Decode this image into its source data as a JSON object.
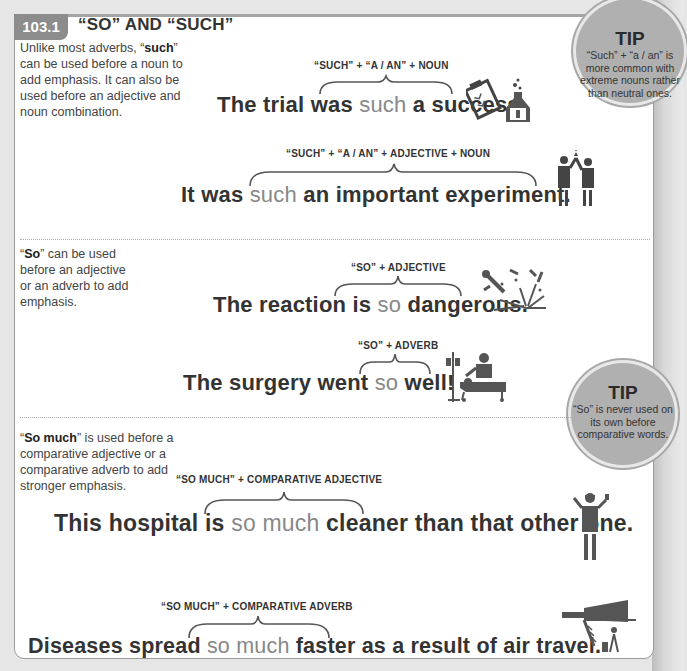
{
  "header": {
    "section_number": "103.1",
    "title": "“SO” AND “SUCH”"
  },
  "sections": [
    {
      "description": {
        "pre": "Unlike most adverbs, “",
        "bold": "such",
        "post": "” can be used before a noun to add emphasis. It can also be used before an adjective and noun combination."
      },
      "examples": [
        {
          "formula": "“SUCH” + “A / AN” + NOUN",
          "sentence": {
            "pre": "The trial was ",
            "highlight": "such",
            "post": " a success."
          },
          "icon": "clipboard-and-flask-icon"
        },
        {
          "formula": "“SUCH” + “A / AN” + ADJECTIVE + NOUN",
          "sentence": {
            "pre": "It was ",
            "highlight": "such",
            "post": " an important experiment."
          },
          "icon": "scientists-celebrating-icon"
        }
      ]
    },
    {
      "description": {
        "pre": "“",
        "bold": "So",
        "post": "” can be used before an adjective or an adverb to add emphasis."
      },
      "examples": [
        {
          "formula": "“SO” + ADJECTIVE",
          "sentence": {
            "pre": "The reaction is ",
            "highlight": "so",
            "post": " dangerous."
          },
          "icon": "explosion-icon"
        },
        {
          "formula": "“SO” + ADVERB",
          "sentence": {
            "pre": "The surgery went ",
            "highlight": "so",
            "post": " well!"
          },
          "icon": "surgery-patient-icon"
        }
      ]
    },
    {
      "description": {
        "pre": "“",
        "bold": "So much",
        "post": "” is used before a comparative adjective or a comparative adverb to add stronger emphasis."
      },
      "examples": [
        {
          "formula": "“SO MUCH” + COMPARATIVE ADJECTIVE",
          "sentence": {
            "pre": "This hospital is ",
            "highlight": "so much",
            "post": " cleaner than that other one."
          },
          "icon": "doctor-icon"
        },
        {
          "formula": "“SO MUCH” + COMPARATIVE ADVERB",
          "sentence": {
            "pre": "Diseases spread ",
            "highlight": "so much",
            "post": " faster as a result of air travel."
          },
          "icon": "airplane-traveler-icon"
        }
      ]
    }
  ],
  "tips": [
    {
      "title": "TIP",
      "body": "“Such” + “a / an” is more common with extreme nouns rather than neutral ones."
    },
    {
      "title": "TIP",
      "body": "“So” is never used on its own before comparative words."
    }
  ],
  "colors": {
    "badge": "#8c8c8c",
    "highlight": "#888888",
    "text": "#333333",
    "tip_bg": "#b0b0b0"
  }
}
